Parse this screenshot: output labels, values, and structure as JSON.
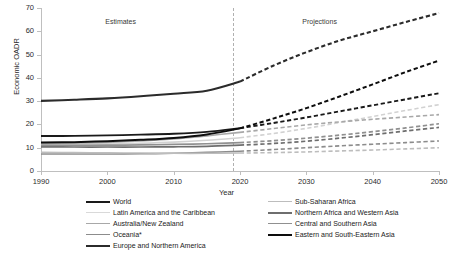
{
  "chart_data": {
    "type": "line",
    "title": "",
    "xlabel": "Year",
    "ylabel": "Economic OADR",
    "xlim": [
      1990,
      2050
    ],
    "ylim": [
      0,
      70
    ],
    "xticks": [
      "1990",
      "2000",
      "2010",
      "2020",
      "2030",
      "2040",
      "2050"
    ],
    "yticks": [
      "0",
      "10",
      "20",
      "30",
      "40",
      "50",
      "60",
      "70"
    ],
    "grid": false,
    "legend_position": "bottom",
    "annotations": [
      {
        "text": "Estimates",
        "x": 2002,
        "y": 64
      },
      {
        "text": "Projections",
        "x": 2032,
        "y": 64
      }
    ],
    "divider": {
      "x": 2019,
      "style": "dashed",
      "color": "#b0b0b0"
    },
    "estimate_end_year": 2020,
    "x": [
      1990,
      1995,
      2000,
      2005,
      2010,
      2015,
      2020,
      2025,
      2030,
      2035,
      2040,
      2045,
      2050
    ],
    "series": [
      {
        "name": "World",
        "color": "#1a1a1a",
        "width": 1.9,
        "values": [
          15.0,
          15.1,
          15.3,
          15.6,
          16.0,
          16.8,
          18.4,
          20.6,
          23.0,
          25.6,
          28.2,
          30.8,
          33.4
        ]
      },
      {
        "name": "Latin America and the Caribbean",
        "color": "#d2d2d2",
        "width": 1.6,
        "values": [
          11.3,
          11.4,
          11.6,
          11.9,
          12.4,
          13.2,
          14.3,
          16.1,
          18.3,
          20.8,
          23.4,
          26.0,
          28.5
        ]
      },
      {
        "name": "Australia/New Zealand",
        "color": "#a8a8a8",
        "width": 1.6,
        "values": [
          11.7,
          12.0,
          12.3,
          12.9,
          13.8,
          15.1,
          16.6,
          18.2,
          19.8,
          21.1,
          22.2,
          23.2,
          24.2
        ]
      },
      {
        "name": "Oceania*",
        "color": "#8c8c8c",
        "width": 1.6,
        "values": [
          7.3,
          7.3,
          7.3,
          7.4,
          7.6,
          8.0,
          8.5,
          9.2,
          10.0,
          10.8,
          11.5,
          12.2,
          12.9
        ]
      },
      {
        "name": "Europe and Northern America",
        "color": "#2b2b2b",
        "width": 2.1,
        "values": [
          30.1,
          30.6,
          31.2,
          32.1,
          33.2,
          34.5,
          38.4,
          45.2,
          51.0,
          56.0,
          60.0,
          64.0,
          67.8
        ]
      },
      {
        "name": "Sub-Saharan Africa",
        "color": "#bdbdbd",
        "width": 1.6,
        "values": [
          8.0,
          7.9,
          7.8,
          7.7,
          7.6,
          7.6,
          7.7,
          7.9,
          8.2,
          8.6,
          9.0,
          9.5,
          10.0
        ]
      },
      {
        "name": "Northern Africa and Western Asia",
        "color": "#6e6e6e",
        "width": 1.7,
        "values": [
          10.4,
          10.3,
          10.3,
          10.3,
          10.4,
          10.6,
          11.1,
          11.8,
          12.8,
          14.1,
          15.6,
          17.2,
          18.7
        ]
      },
      {
        "name": "Central and Southern Asia",
        "color": "#909090",
        "width": 1.7,
        "values": [
          11.0,
          11.0,
          11.1,
          11.2,
          11.4,
          11.7,
          12.2,
          13.0,
          14.1,
          15.4,
          16.9,
          18.5,
          20.3
        ]
      },
      {
        "name": "Eastern and South-Eastern Asia",
        "color": "#0d0d0d",
        "width": 2.0,
        "values": [
          12.2,
          12.4,
          12.8,
          13.4,
          14.2,
          15.7,
          18.3,
          22.5,
          27.0,
          32.0,
          37.2,
          42.5,
          47.4
        ]
      }
    ]
  },
  "legend": {
    "left_items": [
      {
        "label": "World",
        "color": "#1a1a1a",
        "width": 2.4
      },
      {
        "label": "Latin America and the Caribbean",
        "color": "#d9d9d9",
        "width": 1.6
      },
      {
        "label": "Australia/New Zealand",
        "color": "#a8a8a8",
        "width": 1.6
      },
      {
        "label": "Oceania*",
        "color": "#8c8c8c",
        "width": 1.8
      },
      {
        "label": "Europe and Northern America",
        "color": "#2b2b2b",
        "width": 2.6
      }
    ],
    "right_items": [
      {
        "label": "Sub-Saharan Africa",
        "color": "#bdbdbd",
        "width": 1.6
      },
      {
        "label": "Northern Africa and Western Asia",
        "color": "#6e6e6e",
        "width": 2.2
      },
      {
        "label": "Central and Southern Asia",
        "color": "#909090",
        "width": 1.9
      },
      {
        "label": "Eastern and South-Eastern Asia",
        "color": "#0d0d0d",
        "width": 2.4
      }
    ]
  }
}
